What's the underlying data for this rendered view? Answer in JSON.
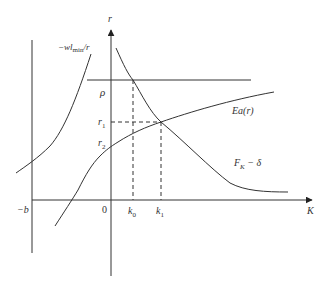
{
  "diagram": {
    "type": "economic-graph",
    "axes": {
      "vertical_label": "r",
      "horizontal_label": "K",
      "origin_label": "0",
      "left_boundary_label": "−b"
    },
    "levels": {
      "rho": "ρ",
      "r1": "r",
      "r1_sub": "1",
      "r2": "r",
      "r2_sub": "2"
    },
    "k_marks": {
      "k0": "k",
      "k0_sub": "0",
      "k1": "k",
      "k1_sub": "1"
    },
    "curves": {
      "left_curve_label_prefix": "−wl",
      "left_curve_label_sub": "min",
      "left_curve_label_suffix": "/r",
      "ea_label": "Ea(r)",
      "fk_label_main": "F",
      "fk_label_sub": "K",
      "fk_label_suffix": " − δ"
    },
    "colors": {
      "line": "#333333",
      "background": "#ffffff"
    }
  }
}
